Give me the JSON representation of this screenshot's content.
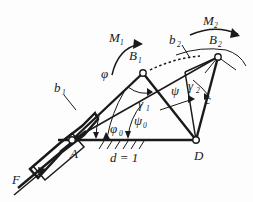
{
  "figure": {
    "type": "kinematic-linkage-diagram",
    "background_color": "#fdfdfd",
    "ink_color": "#1a1a1a"
  },
  "labels": {
    "force": "F",
    "moment_1": "M",
    "moment_1_sub": "1",
    "moment_2": "M",
    "moment_2_sub": "2",
    "joint_a": "A",
    "joint_d": "D",
    "joint_b1": "B",
    "joint_b1_sub": "1",
    "joint_b2": "B",
    "joint_b2_sub": "2",
    "link_b1": "b",
    "link_b1_sub": "1",
    "link_b2": "b",
    "link_b2_sub": "2",
    "link_c": "c",
    "ground_length": "d = 1",
    "angle_phi": "φ",
    "angle_phi0": "φ",
    "angle_phi0_sub": "0",
    "angle_psi": "ψ",
    "angle_psi0": "ψ",
    "angle_psi0_sub": "0",
    "angle_gamma1": "γ",
    "angle_gamma1_sub": "1",
    "angle_gamma2": "γ",
    "angle_gamma2_sub": "2"
  },
  "geometry": {
    "joint_a": [
      72,
      140
    ],
    "joint_d": [
      196,
      140
    ],
    "joint_b1": [
      143,
      73
    ],
    "joint_b2": [
      218,
      57
    ],
    "ground_line": [
      [
        60,
        140
      ],
      [
        200,
        140
      ]
    ],
    "ground_length_value": 1
  }
}
